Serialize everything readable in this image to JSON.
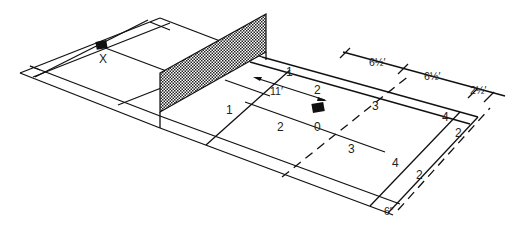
{
  "diagram": {
    "type": "badminton-court-oblique",
    "markers": {
      "x_label": "X",
      "o_label": "0"
    },
    "zone_labels": {
      "zone1_far": "1",
      "zone1_near": "1",
      "zone2_a": "2",
      "zone2_b": "2",
      "zone3_a": "3",
      "zone3_b": "3",
      "zone4_a": "4",
      "zone4_b": "4",
      "zone2_out_a": "2",
      "zone2_out_b": "2"
    },
    "dimensions": {
      "d_11": "11′",
      "d_6half_a": "6½′",
      "d_6half_b": "6½′",
      "d_2half": "2½′",
      "d_6in": "6″"
    },
    "colors": {
      "line": "#111111",
      "background": "#ffffff",
      "marker": "#111111"
    }
  }
}
